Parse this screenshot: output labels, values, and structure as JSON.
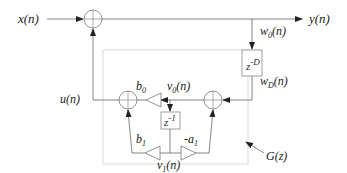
{
  "diagram": {
    "type": "signal-flow block diagram",
    "colors": {
      "line": "#555555",
      "box_border": "#d8d8d8",
      "text": "#222222"
    },
    "signals": {
      "input": "x(n)",
      "output": "y(n)",
      "feedback": "u(n)",
      "w0": {
        "base": "w",
        "sub": "0",
        "arg": "(n)"
      },
      "wD": {
        "base": "w",
        "sub": "D",
        "arg": "(n)"
      },
      "v0": {
        "base": "v",
        "sub": "0",
        "arg": "(n)"
      },
      "v1": {
        "base": "v",
        "sub": "1",
        "arg": "(n)"
      }
    },
    "blocks": {
      "delay_D": {
        "base": "z",
        "sup": "-D"
      },
      "delay_1": {
        "base": "z",
        "sup": "-1"
      }
    },
    "gains": {
      "b0": {
        "base": "b",
        "sub": "0"
      },
      "b1": {
        "base": "b",
        "sub": "1"
      },
      "a1": {
        "base": "-a",
        "sub": "1"
      }
    },
    "subsystem_label": "G(z)",
    "nodes": [
      {
        "id": "sum-top",
        "type": "adder"
      },
      {
        "id": "sum-left",
        "type": "adder"
      },
      {
        "id": "sum-right",
        "type": "adder"
      }
    ]
  }
}
